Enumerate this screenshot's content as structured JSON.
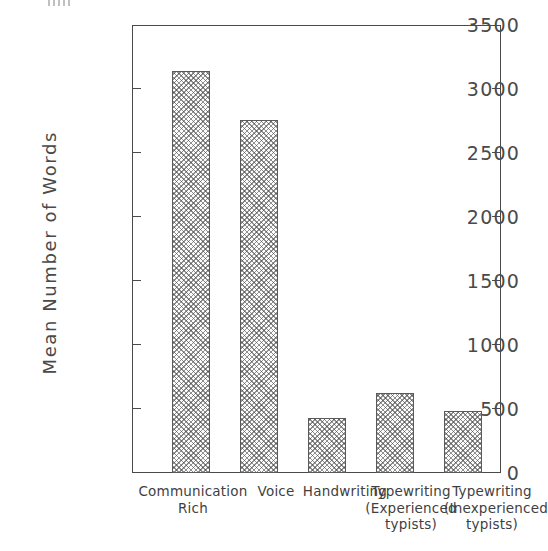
{
  "chart_data": {
    "type": "bar",
    "title": "",
    "subtitle": "",
    "xlabel": "",
    "ylabel": "Mean  Number  of  Words",
    "ylim": [
      0,
      3500
    ],
    "ytick_values": [
      0,
      500,
      1000,
      1500,
      2000,
      2500,
      3000,
      3500
    ],
    "ytick_labels": [
      "0",
      "500",
      "1000",
      "1500",
      "2000",
      "2500",
      "3000",
      "3500"
    ],
    "grid": false,
    "legend": null,
    "categories": [
      "Communication\nRich",
      "Voice",
      "Handwriting",
      "Typewriting\n(Experienced\ntypists)",
      "Typewriting\n(Inexperienced\ntypists)"
    ],
    "values": [
      3140,
      2755,
      430,
      625,
      485
    ],
    "bar_fill": "cross-hatch",
    "bar_edge_color": "#5a5a5a",
    "axis_color": "#4a4a4a",
    "background_color": "#ffffff"
  },
  "axes": {
    "frame": {
      "top_tick_label": "3500",
      "bottom_tick_label": "0"
    }
  }
}
